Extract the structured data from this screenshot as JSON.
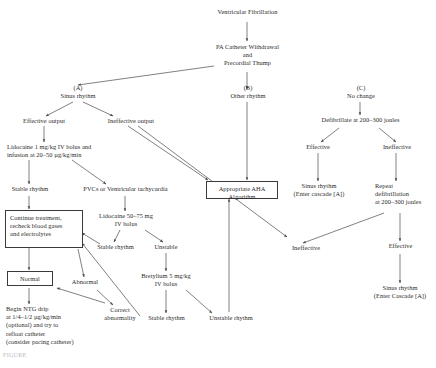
{
  "figure": {
    "caption_artifact": "FIGURE"
  },
  "colors": {
    "line": "#4a4a4a",
    "text": "#2b2b2b",
    "box_border": "#3a3a3a",
    "background": "#ffffff"
  },
  "nodes": {
    "root": "Ventricular Fibrillation",
    "pa_catheter": "PA Catheter Withdrawal\nand\nPrecordial Thump",
    "branch_a_label": "(A)\nSinus rhythm",
    "branch_b_label": "(B)\nOther rhythm",
    "branch_c_label": "(C)\nNo change",
    "effective_output": "Effective output",
    "ineffective_output": "Ineffective output",
    "lidocaine_1": "Lidocaine 1 mg/kg IV bolus and\ninfusion at 20–50 µg/kg/min",
    "stable_rhythm_1": "Stable rhythm",
    "pvcs_vt": "PVCs or Ventricular tachycardia",
    "continue_treatment": "Continue treatment,\nrecheck blood gases\nand electrolytes",
    "lidocaine_2": "Lidocaine 50–75 mg\nIV bolus",
    "stable_rhythm_2": "Stable rhythm",
    "unstable": "Unstable",
    "normal": "Normal",
    "abnormal": "Abnormal",
    "bretylium": "Bretylium 5 mg/kg\nIV bolus",
    "stable_rhythm_3": "Stable rhythm",
    "unstable_rhythm": "Unstable rhythm",
    "correct_abnormality": "Correct\nabnormality",
    "ntg_drip": "Begin NTG drip\nat 1/4–1/2 µg/kg/min\n(optional) and try to\nrefloat catheter\n(consider pacing catheter)",
    "aha_algorithm": "Appropriate AHA\nAlgorithm",
    "defibrillate": "Defibrillate at 200–300 joules",
    "effective_c": "Effective",
    "ineffective_c": "Ineffective",
    "sinus_rhythm_cascade_1": "Sinus rhythm\n(Enter cascade [A])",
    "repeat_defibrillation": "Repeat\ndefibrillation\nat 200–300 joules",
    "ineffective_2": "Ineffective",
    "effective_2": "Effective",
    "sinus_rhythm_cascade_2": "Sinus rhythm\n(Enter Cascade [A])"
  }
}
